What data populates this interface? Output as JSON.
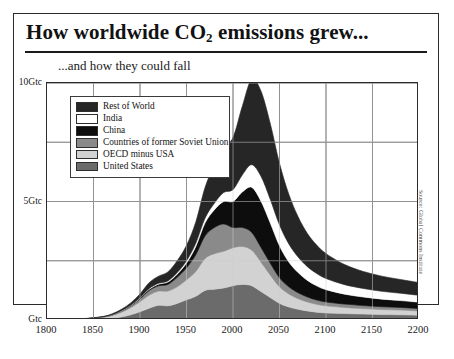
{
  "header": {
    "title_pre": "How worldwide CO",
    "title_sub": "2",
    "title_post": " emissions grew...",
    "subtitle": "...and how they could fall"
  },
  "source": "Source: Global Commons Institute",
  "legend": {
    "items": [
      {
        "label": "Rest of World",
        "color": "#262626"
      },
      {
        "label": "India",
        "color": "#ffffff"
      },
      {
        "label": "China",
        "color": "#0d0d0d"
      },
      {
        "label": "Countries of former Soviet Union",
        "color": "#8a8a8a"
      },
      {
        "label": "OECD minus USA",
        "color": "#d2d2d2"
      },
      {
        "label": "United States",
        "color": "#6b6b6b"
      }
    ]
  },
  "chart_data": {
    "type": "area",
    "xlabel": "",
    "ylabel": "Gtc",
    "stacked": true,
    "grid": true,
    "legend_position": "inside-top-left",
    "xlim": [
      1800,
      2200
    ],
    "ylim": [
      0,
      10
    ],
    "xticks": [
      1800,
      1850,
      1900,
      1950,
      2000,
      2050,
      2100,
      2150,
      2200
    ],
    "xtick_labels": [
      "1800",
      "1850",
      "1900",
      "1950",
      "2000",
      "2050",
      "2100",
      "2150",
      "2200"
    ],
    "yticks": [
      0,
      5,
      10
    ],
    "ytick_labels": [
      "Gtc",
      "5Gtc",
      "10Gtc"
    ],
    "y_gridlines": [
      0,
      2.5,
      5,
      7.5,
      10
    ],
    "x": [
      1800,
      1820,
      1840,
      1860,
      1870,
      1880,
      1890,
      1900,
      1910,
      1920,
      1930,
      1940,
      1950,
      1960,
      1970,
      1980,
      1990,
      2000,
      2010,
      2020,
      2030,
      2040,
      2050,
      2060,
      2070,
      2080,
      2090,
      2100,
      2120,
      2140,
      2160,
      2180,
      2200
    ],
    "series": [
      {
        "name": "United States",
        "color": "#6b6b6b",
        "values": [
          0.0,
          0.0,
          0.01,
          0.04,
          0.07,
          0.13,
          0.22,
          0.35,
          0.5,
          0.62,
          0.6,
          0.7,
          0.85,
          1.0,
          1.25,
          1.3,
          1.35,
          1.45,
          1.5,
          1.45,
          1.2,
          0.95,
          0.7,
          0.55,
          0.45,
          0.38,
          0.33,
          0.3,
          0.27,
          0.25,
          0.23,
          0.22,
          0.2
        ]
      },
      {
        "name": "OECD minus USA",
        "color": "#d2d2d2",
        "values": [
          0.01,
          0.02,
          0.04,
          0.08,
          0.12,
          0.2,
          0.3,
          0.42,
          0.55,
          0.6,
          0.62,
          0.7,
          0.85,
          1.05,
          1.35,
          1.5,
          1.55,
          1.6,
          1.6,
          1.5,
          1.25,
          0.95,
          0.7,
          0.55,
          0.45,
          0.38,
          0.33,
          0.3,
          0.26,
          0.23,
          0.21,
          0.2,
          0.18
        ]
      },
      {
        "name": "Countries of former Soviet Union",
        "color": "#8a8a8a",
        "values": [
          0.0,
          0.0,
          0.0,
          0.01,
          0.02,
          0.04,
          0.07,
          0.12,
          0.2,
          0.22,
          0.28,
          0.4,
          0.5,
          0.7,
          0.95,
          1.1,
          1.15,
          0.85,
          0.8,
          0.75,
          0.62,
          0.5,
          0.38,
          0.3,
          0.25,
          0.21,
          0.18,
          0.16,
          0.14,
          0.13,
          0.12,
          0.11,
          0.1
        ]
      },
      {
        "name": "China",
        "color": "#0d0d0d",
        "values": [
          0.0,
          0.0,
          0.0,
          0.0,
          0.01,
          0.01,
          0.02,
          0.03,
          0.05,
          0.07,
          0.1,
          0.13,
          0.2,
          0.35,
          0.55,
          0.75,
          0.95,
          1.1,
          1.5,
          1.9,
          1.95,
          1.7,
          1.35,
          1.05,
          0.85,
          0.7,
          0.6,
          0.52,
          0.42,
          0.36,
          0.32,
          0.29,
          0.27
        ]
      },
      {
        "name": "India",
        "color": "#ffffff",
        "values": [
          0.0,
          0.0,
          0.0,
          0.0,
          0.0,
          0.01,
          0.01,
          0.02,
          0.03,
          0.04,
          0.05,
          0.07,
          0.1,
          0.14,
          0.2,
          0.28,
          0.38,
          0.5,
          0.72,
          0.95,
          1.05,
          1.0,
          0.88,
          0.76,
          0.66,
          0.58,
          0.52,
          0.47,
          0.4,
          0.36,
          0.33,
          0.31,
          0.29
        ]
      },
      {
        "name": "Rest of World",
        "color": "#262626",
        "values": [
          0.0,
          0.01,
          0.01,
          0.02,
          0.04,
          0.06,
          0.1,
          0.16,
          0.25,
          0.3,
          0.38,
          0.5,
          0.65,
          0.9,
          1.3,
          1.6,
          1.9,
          2.2,
          2.9,
          3.6,
          3.6,
          3.2,
          2.6,
          2.1,
          1.7,
          1.4,
          1.2,
          1.05,
          0.85,
          0.72,
          0.64,
          0.58,
          0.54
        ]
      }
    ],
    "total_peak": {
      "year": 2025,
      "value": 8.6
    },
    "annotations": []
  }
}
